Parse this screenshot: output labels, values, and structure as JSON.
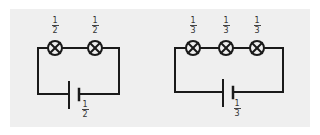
{
  "colors": {
    "page_background": "#ffffff",
    "panel_background": "#efefef",
    "line": "#1a1a1a"
  },
  "circuits": [
    {
      "name": "two-bulb-series-circuit",
      "bulbs": [
        {
          "numerator": "1",
          "denominator": "2"
        },
        {
          "numerator": "1",
          "denominator": "2"
        }
      ],
      "battery": {
        "numerator": "1",
        "denominator": "2"
      }
    },
    {
      "name": "three-bulb-series-circuit",
      "bulbs": [
        {
          "numerator": "1",
          "denominator": "3"
        },
        {
          "numerator": "1",
          "denominator": "3"
        },
        {
          "numerator": "1",
          "denominator": "3"
        }
      ],
      "battery": {
        "numerator": "1",
        "denominator": "3"
      }
    }
  ]
}
